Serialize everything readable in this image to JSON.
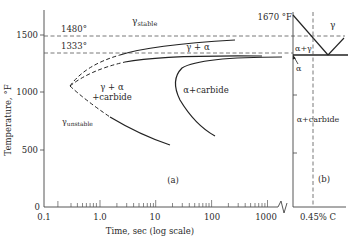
{
  "panel_a": {
    "label": "(a)",
    "y_axis": {
      "title": "Temperature, °F",
      "ticks": [
        "0",
        "500",
        "1000",
        "1500"
      ]
    },
    "x_axis": {
      "title": "Time, sec (log scale)",
      "ticks": [
        "0.1",
        "1.0",
        "10",
        "100",
        "1000"
      ]
    },
    "reference_lines": [
      {
        "label": "1480°",
        "value": 1480
      },
      {
        "label": "1333°",
        "value": 1333
      }
    ],
    "regions": {
      "gamma_stable": "γ",
      "gamma_stable_sub": "stable",
      "gamma_alpha": "γ + α",
      "gamma_alpha_carbide_1": "γ + α",
      "gamma_alpha_carbide_2": "+carbide",
      "alpha_carbide": "α+carbide",
      "gamma_unstable": "γ",
      "gamma_unstable_sub": "unstable"
    }
  },
  "panel_b": {
    "label": "(b)",
    "top_temp": "1670 °F",
    "composition": "0.45% C",
    "regions": {
      "gamma": "γ",
      "alpha_gamma": "α+γ",
      "alpha": "α",
      "alpha_carbide": "α+carbide"
    }
  }
}
